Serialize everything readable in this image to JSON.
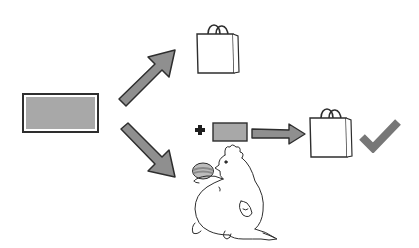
{
  "diagram": {
    "title": "",
    "colors": {
      "background": "#ffffff",
      "stroke": "#2e2e2e",
      "fill_gray": "#a8a8a8",
      "arrow_fill": "#8f8f8f",
      "check": "#777777",
      "egg_light": "#bdbdbd",
      "egg_dark": "#8a8a8a"
    },
    "nodes": [
      {
        "id": "source-box",
        "shape": "rectangle",
        "label": ""
      },
      {
        "id": "bag-top",
        "shape": "shopping-bag-icon",
        "label": ""
      },
      {
        "id": "plus",
        "shape": "plus-icon",
        "label": ""
      },
      {
        "id": "small-box",
        "shape": "rectangle",
        "label": ""
      },
      {
        "id": "bag-bottom",
        "shape": "shopping-bag-icon",
        "label": ""
      },
      {
        "id": "check",
        "shape": "checkmark-icon",
        "label": ""
      },
      {
        "id": "chicken",
        "shape": "chicken-illustration",
        "label": ""
      },
      {
        "id": "egg",
        "shape": "striped-egg-illustration",
        "label": ""
      }
    ],
    "edges": [
      {
        "from": "source-box",
        "to": "bag-top",
        "style": "thick-arrow"
      },
      {
        "from": "source-box",
        "to": "chicken",
        "style": "thick-arrow"
      },
      {
        "from": "small-box",
        "to": "bag-bottom",
        "style": "thick-arrow"
      }
    ]
  }
}
